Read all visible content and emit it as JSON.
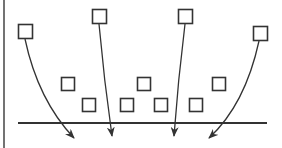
{
  "diagram": {
    "width": 282,
    "height": 148,
    "stroke_color": "#333333",
    "border_color": "#444444",
    "left_border": {
      "x": 4,
      "y1": 0,
      "y2": 148
    },
    "baseline": {
      "x1": 18,
      "x2": 267,
      "y": 123
    },
    "top_squares": [
      {
        "x": 18,
        "y": 24,
        "size": 14
      },
      {
        "x": 92,
        "y": 9,
        "size": 14
      },
      {
        "x": 178,
        "y": 9,
        "size": 14
      },
      {
        "x": 253,
        "y": 26,
        "size": 14
      }
    ],
    "lower_squares": [
      {
        "x": 61,
        "y": 77,
        "size": 13
      },
      {
        "x": 82,
        "y": 98,
        "size": 13
      },
      {
        "x": 120,
        "y": 98,
        "size": 13
      },
      {
        "x": 137,
        "y": 77,
        "size": 13
      },
      {
        "x": 154,
        "y": 98,
        "size": 13
      },
      {
        "x": 189,
        "y": 98,
        "size": 13
      },
      {
        "x": 212,
        "y": 77,
        "size": 13
      }
    ],
    "arrows": [
      {
        "from": [
          25,
          39
        ],
        "ctrl": [
          38,
          100
        ],
        "to": [
          74,
          138
        ]
      },
      {
        "from": [
          99,
          24
        ],
        "ctrl": [
          104,
          80
        ],
        "to": [
          112,
          136
        ]
      },
      {
        "from": [
          185,
          24
        ],
        "ctrl": [
          178,
          80
        ],
        "to": [
          174,
          136
        ]
      },
      {
        "from": [
          259,
          41
        ],
        "ctrl": [
          245,
          105
        ],
        "to": [
          209,
          138
        ]
      }
    ]
  }
}
